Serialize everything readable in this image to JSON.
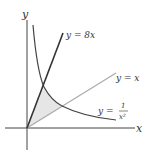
{
  "diagram": {
    "axes": {
      "x_label": "x",
      "y_label": "y",
      "axis_color": "#444444"
    },
    "curves": [
      {
        "id": "line-8x",
        "label": "y = 8x",
        "color": "#333333"
      },
      {
        "id": "line-x",
        "label": "y = x",
        "color": "#aaaaaa"
      },
      {
        "id": "curve-inv-x2",
        "label_prefix": "y = ",
        "fraction_num": "1",
        "fraction_den": "x²",
        "color": "#444444"
      }
    ],
    "shaded_region": {
      "fill": "#e6e6e6",
      "description": "region bounded by y = 8x, y = x, and y = 1/x²"
    }
  }
}
